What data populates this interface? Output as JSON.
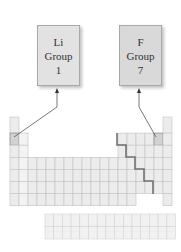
{
  "labels": [
    {
      "element": "Li",
      "group_word": "Group",
      "group_number": "1"
    },
    {
      "element": "F",
      "group_word": "Group",
      "group_number": "7"
    }
  ],
  "periodic_table": {
    "columns": 18,
    "rows": 7,
    "f_block_rows": 2,
    "highlighted": [
      "Li",
      "F"
    ],
    "staircase_line": "metal/non-metal boundary"
  },
  "colors": {
    "box_fill": "#e2e2e2",
    "cell_fill": "#ececec",
    "grid_line": "#c4c4c4",
    "staircase": "#707070",
    "arrow": "#555555"
  }
}
